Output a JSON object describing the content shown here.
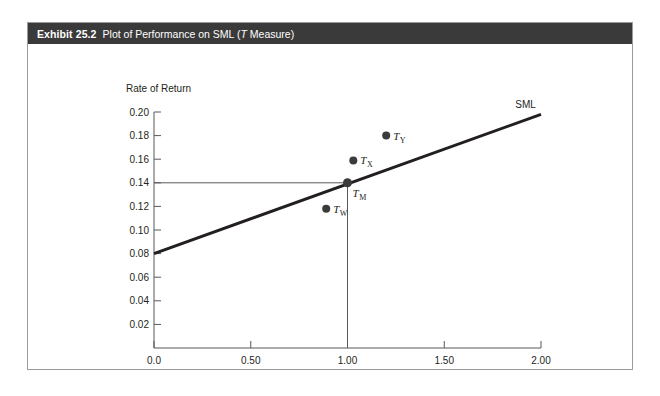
{
  "exhibit": {
    "number": "Exhibit 25.2",
    "caption_prefix": "Plot of Performance on SML (",
    "caption_italic": "T",
    "caption_suffix": " Measure)"
  },
  "colors": {
    "title_bar_bg": "#3a3a3a",
    "title_bar_text": "#ffffff",
    "frame_border": "#9a9a9a",
    "axis": "#58595b",
    "sml_line": "#231f20",
    "guide_line": "#58595b",
    "point_fill": "#3b3b3b",
    "text": "#231f20"
  },
  "chart_data": {
    "type": "scatter",
    "title": "Plot of Performance on SML (T Measure)",
    "xlabel": "Beta",
    "ylabel": "Rate of Return",
    "xlim": [
      0.0,
      2.0
    ],
    "ylim": [
      0.0,
      0.2
    ],
    "grid": false,
    "legend": "none",
    "xticks": [
      0.0,
      0.5,
      1.0,
      1.5,
      2.0
    ],
    "xticklabels": [
      "0.0",
      "0.50",
      "1.00",
      "1.50",
      "2.00"
    ],
    "yticks": [
      0.02,
      0.04,
      0.06,
      0.08,
      0.1,
      0.12,
      0.14,
      0.16,
      0.18,
      0.2
    ],
    "yticklabels": [
      "0.02",
      "0.04",
      "0.06",
      "0.08",
      "0.10",
      "0.12",
      "0.14",
      "0.16",
      "0.18",
      "0.20"
    ],
    "points": [
      {
        "id": "TW",
        "label_base": "T",
        "label_sub": "W",
        "x": 0.89,
        "y": 0.118
      },
      {
        "id": "TM",
        "label_base": "T",
        "label_sub": "M",
        "x": 1.0,
        "y": 0.14
      },
      {
        "id": "TX",
        "label_base": "T",
        "label_sub": "X",
        "x": 1.03,
        "y": 0.159
      },
      {
        "id": "TY",
        "label_base": "T",
        "label_sub": "Y",
        "x": 1.2,
        "y": 0.18
      }
    ],
    "lines": [
      {
        "id": "SML",
        "label": "SML",
        "x": [
          0.0,
          2.0
        ],
        "y": [
          0.08,
          0.198
        ],
        "intercept": 0.08,
        "slope": 0.059,
        "width": 3
      }
    ],
    "guides": [
      {
        "id": "market-return-guide",
        "orientation": "horizontal",
        "value": 0.14,
        "from_x": 0.0,
        "to_x": 1.0
      },
      {
        "id": "market-beta-guide",
        "orientation": "vertical",
        "value": 1.0,
        "from_y": 0.0,
        "to_y": 0.14
      }
    ],
    "annotations": [
      {
        "id": "sml-annotation",
        "text": "SML",
        "x": 1.92,
        "y": 0.203
      }
    ]
  }
}
